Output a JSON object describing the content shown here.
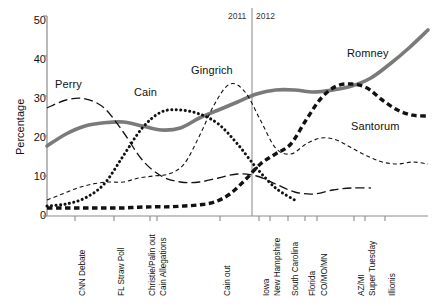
{
  "chart_data": {
    "type": "line",
    "title": "",
    "subtitle": "",
    "xlabel": "",
    "ylabel": "Percentage",
    "ylim": [
      0,
      50
    ],
    "yticks": [
      0,
      10,
      20,
      30,
      40,
      50
    ],
    "ytick_labels": [
      "0",
      "10",
      "20",
      "30",
      "40",
      "50"
    ],
    "grid": false,
    "legend_position": "inline-labels",
    "x_categories": [
      "CNN Debate",
      "FL Straw Poll",
      "Christie/Palin out",
      "Cain Allegations",
      "Cain out",
      "Iowa",
      "New Hampshire",
      "South Carolina",
      "Florida",
      "CO/MO/MN",
      "AZ/MI",
      "Super Tuesday",
      "Illionis"
    ],
    "annotations": [
      {
        "text": "2011",
        "kind": "era-label",
        "side": "left-of-divider"
      },
      {
        "text": "2012",
        "kind": "era-label",
        "side": "right-of-divider"
      },
      {
        "text": "divider",
        "kind": "vertical-rule",
        "at_category": "between Cain out and Iowa"
      }
    ],
    "series": [
      {
        "name": "Romney",
        "style": "thick-solid-gray",
        "color": "#7a7a7a",
        "label_text": "Romney",
        "values": [
          17.5,
          20.5,
          22.5,
          23.3,
          23.5,
          22.5,
          21.5,
          22.0,
          24.5,
          26.5,
          28.5,
          30.5,
          31.5,
          31.5,
          31.0,
          31.5,
          32.5,
          34.5,
          38.0,
          42.0,
          46.5
        ]
      },
      {
        "name": "Perry",
        "style": "long-dash-black",
        "color": "#111111",
        "label_text": "Perry",
        "values": [
          27.0,
          29.0,
          29.3,
          27.0,
          21.0,
          14.0,
          10.0,
          8.5,
          8.5,
          9.5,
          10.5,
          10.0,
          8.0,
          6.0,
          5.5,
          6.5,
          7.0,
          7.0,
          null,
          null,
          null
        ]
      },
      {
        "name": "Cain",
        "style": "dotted-black",
        "color": "#111111",
        "label_text": "Cain",
        "values": [
          2.5,
          3.0,
          4.5,
          8.0,
          15.0,
          22.0,
          26.0,
          26.5,
          25.5,
          23.0,
          18.0,
          12.0,
          7.0,
          4.0,
          null,
          null,
          null,
          null,
          null,
          null,
          null
        ]
      },
      {
        "name": "Gingrich",
        "style": "thin-dash-black",
        "color": "#111111",
        "label_text": "Gingrich",
        "values": [
          4.0,
          5.5,
          7.0,
          8.0,
          8.5,
          8.5,
          9.5,
          10.0,
          10.5,
          13.0,
          20.0,
          28.0,
          33.0,
          31.0,
          24.0,
          17.0,
          15.5,
          18.0,
          19.5,
          19.0,
          17.0,
          15.0,
          13.5,
          13.0,
          13.5,
          13.0
        ]
      },
      {
        "name": "Santorum",
        "style": "thick-dash-black",
        "color": "#111111",
        "label_text": "Santorum",
        "values": [
          2.0,
          2.0,
          2.0,
          2.0,
          2.0,
          2.0,
          2.2,
          2.3,
          2.3,
          2.5,
          2.8,
          3.5,
          5.5,
          9.0,
          13.0,
          15.5,
          18.0,
          24.0,
          29.5,
          32.5,
          33.0,
          32.0,
          29.0,
          26.5,
          25.2,
          25.0
        ]
      }
    ]
  },
  "axis": {
    "y_title": "Percentage"
  },
  "era": {
    "left": "2011",
    "right": "2012"
  },
  "xticks": [
    {
      "label": "CNN Debate"
    },
    {
      "label": "FL Straw Poll"
    },
    {
      "label": "Christie/Palin out"
    },
    {
      "label": "Cain Allegations"
    },
    {
      "label": "Cain out"
    },
    {
      "label": "Iowa"
    },
    {
      "label": "New Hampshire"
    },
    {
      "label": "South Carolina"
    },
    {
      "label": "Florida"
    },
    {
      "label": "CO/MO/MN"
    },
    {
      "label": "AZ/MI"
    },
    {
      "label": "Super Tuesday"
    },
    {
      "label": "Illionis"
    }
  ],
  "yticks": [
    {
      "label": "50"
    },
    {
      "label": "40"
    },
    {
      "label": "30"
    },
    {
      "label": "20"
    },
    {
      "label": "10"
    },
    {
      "label": "0"
    }
  ],
  "series_labels": {
    "perry": "Perry",
    "cain": "Cain",
    "gingrich": "Gingrich",
    "romney": "Romney",
    "santorum": "Santorum"
  },
  "colors": {
    "romney_line": "#7a7a7a",
    "other_lines": "#111111",
    "axis": "#8a8a8a",
    "text": "#111111"
  }
}
